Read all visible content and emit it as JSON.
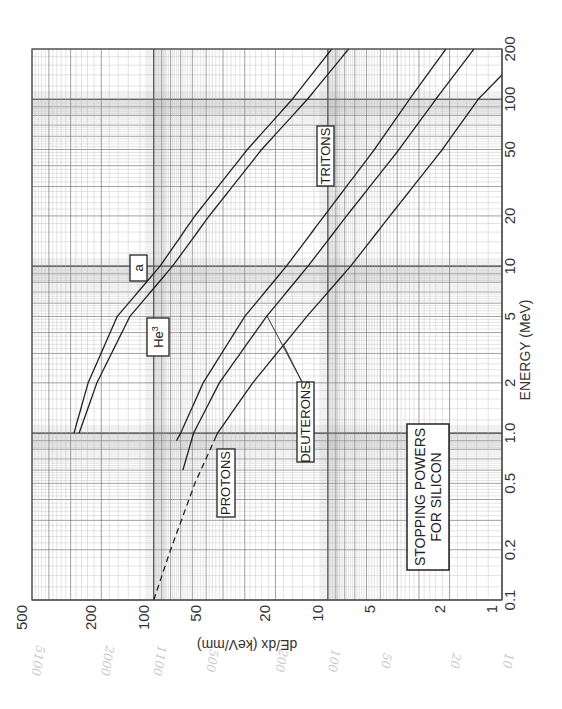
{
  "chart_data": {
    "type": "line",
    "title": "STOPPING POWERS FOR SILICON",
    "xlabel": "ENERGY (MeV)",
    "ylabel": "dE/dx (keV/mm)",
    "x_scale": "log",
    "y_scale": "log",
    "xlim": [
      0.1,
      200
    ],
    "ylim": [
      1,
      500
    ],
    "orientation_note": "page rotated 90 degrees: energy runs bottom-to-top on the right edge, dE/dx runs right-to-left along the bottom edge",
    "x_ticks": [
      "0.1",
      "0.2",
      "0.5",
      "1.0",
      "2",
      "5",
      "10",
      "20",
      "50",
      "100",
      "200"
    ],
    "y_ticks": [
      "1",
      "2",
      "5",
      "10",
      "20",
      "50",
      "100",
      "200",
      "500"
    ],
    "grid": true,
    "series": [
      {
        "name": "α",
        "label": "a",
        "style": "solid",
        "x": [
          1.0,
          2,
          5,
          10,
          20,
          50,
          100,
          200
        ],
        "y": [
          287,
          238,
          162,
          92,
          58,
          29,
          16,
          9.5
        ]
      },
      {
        "name": "He3",
        "label": "He3",
        "style": "solid",
        "x": [
          1.0,
          2,
          5,
          10,
          20,
          50,
          100,
          200
        ],
        "y": [
          268,
          212,
          137,
          78,
          48,
          24,
          13.1,
          7.6
        ]
      },
      {
        "name": "Tritons",
        "label": "TRITONS",
        "style": "solid",
        "x": [
          0.9,
          1.0,
          2,
          5,
          10,
          20,
          50,
          100,
          200
        ],
        "y": [
          74,
          70,
          52,
          30,
          17.3,
          10.5,
          5.4,
          3.4,
          2.1
        ]
      },
      {
        "name": "Deuterons",
        "label": "DEUTERONS",
        "style": "solid",
        "x": [
          0.6,
          1.0,
          2,
          5,
          10,
          20,
          50,
          100,
          200
        ],
        "y": [
          68,
          59,
          42,
          22.5,
          13,
          7.8,
          3.9,
          2.4,
          1.45
        ]
      },
      {
        "name": "Protons",
        "label": "PROTONS",
        "style": "dashed below ~1 MeV",
        "x": [
          0.1,
          0.2,
          0.5,
          1.0,
          2,
          5,
          10,
          20,
          50,
          100,
          140
        ],
        "y": [
          100,
          80,
          58,
          43,
          27,
          13.2,
          7.4,
          4.4,
          2.2,
          1.37,
          1.0
        ]
      }
    ],
    "annotations": [
      "a",
      "He3",
      "TRITONS",
      "DEUTERONS",
      "PROTONS",
      "STOPPING POWERS FOR SILICON"
    ]
  },
  "labels": {
    "alpha": "a",
    "he3_base": "He",
    "he3_sup": "3",
    "tritons": "TRITONS",
    "deuterons": "DEUTERONS",
    "protons": "PROTONS",
    "title_line1": "STOPPING POWERS",
    "title_line2": "FOR SILICON",
    "energy_axis": "ENERGY (MeV)",
    "dedx_axis": "dE/dx (keV/mm)"
  },
  "energy_ticks": [
    "0.1",
    "0.2",
    "0.5",
    "1.0",
    "2",
    "5",
    "10",
    "20",
    "50",
    "100",
    "200"
  ],
  "dedx_ticks": [
    "500",
    "200",
    "100",
    "50",
    "20",
    "10",
    "5",
    "2",
    "1"
  ],
  "pencil_notes": [
    "5100",
    "2000",
    "1100",
    "500",
    "200",
    "100",
    "50",
    "20",
    "10"
  ]
}
